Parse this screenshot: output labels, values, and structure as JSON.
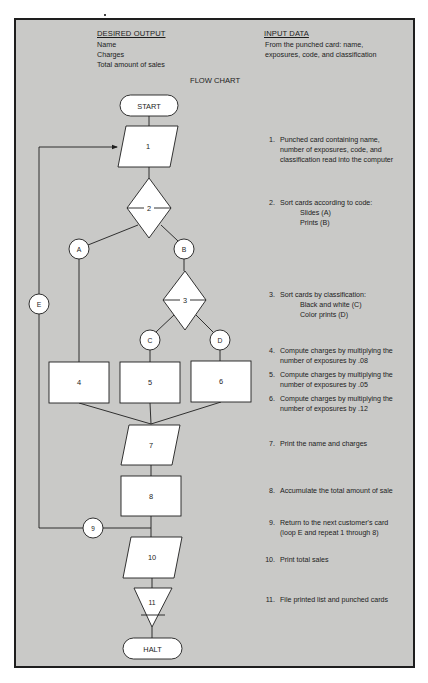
{
  "header": {
    "desired_output": {
      "title": "DESIRED OUTPUT",
      "items": [
        "Name",
        "Charges",
        "Total amount of sales"
      ]
    },
    "input_data": {
      "title": "INPUT DATA",
      "lines": [
        "From the punched card: name,",
        "exposures, code, and classification"
      ]
    },
    "chart_title": "FLOW CHART"
  },
  "flowchart": {
    "terminals": {
      "start": "START",
      "halt": "HALT"
    },
    "nodes": {
      "n1": "1",
      "n2": "2",
      "n3": "3",
      "n4": "4",
      "n5": "5",
      "n6": "6",
      "n7": "7",
      "n8": "8",
      "n10": "10",
      "n11": "11"
    },
    "connectors": {
      "a": "A",
      "b": "B",
      "c": "C",
      "d": "D",
      "e": "E",
      "n9": "9"
    }
  },
  "steps": [
    {
      "num": "1.",
      "lines": [
        "Punched card containing name,",
        "number of exposures, code, and",
        "classification read into the computer"
      ]
    },
    {
      "num": "2.",
      "lines": [
        "Sort cards according to code:"
      ],
      "sub": [
        "Slides (A)",
        "Prints (B)"
      ]
    },
    {
      "num": "3.",
      "lines": [
        "Sort cards by classification:"
      ],
      "sub": [
        "Black and white (C)",
        "Color prints (D)"
      ]
    },
    {
      "num": "4.",
      "lines": [
        "Compute charges by multiplying the",
        "number of exposures by .08"
      ]
    },
    {
      "num": "5.",
      "lines": [
        "Compute charges by multiplying the",
        "number of exposures by .05"
      ]
    },
    {
      "num": "6.",
      "lines": [
        "Compute charges by multiplying the",
        "number of exposures by .12"
      ]
    },
    {
      "num": "7.",
      "lines": [
        "Print the name and charges"
      ]
    },
    {
      "num": "8.",
      "lines": [
        "Accumulate the total amount of sale"
      ]
    },
    {
      "num": "9.",
      "lines": [
        "Return to the next customer's card",
        "(loop E and repeat 1 through 8)"
      ]
    },
    {
      "num": "10.",
      "lines": [
        "Print total sales"
      ]
    },
    {
      "num": "11.",
      "lines": [
        "File printed list and punched cards"
      ]
    }
  ],
  "colors": {
    "panel_bg": "#c9c9c7",
    "shape_fill": "#ffffff",
    "stroke": "#1e1e1e"
  }
}
